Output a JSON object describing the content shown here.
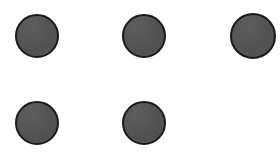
{
  "canvas": {
    "width": 280,
    "height": 166,
    "background_color": "#ffffff"
  },
  "figure": {
    "shape_count": 5,
    "grid": {
      "columns": 3,
      "rows": 2,
      "missing_slots": [
        "row-2-col-3"
      ]
    },
    "fill_color": "#4f4f4f",
    "stroke_color": "#1a1a1a"
  },
  "shapes": [
    {
      "name": "circle-row1-col1",
      "row": 1,
      "column": 1,
      "x": 15,
      "y": 14,
      "diameter": 44,
      "border_width": 2,
      "fill": "#4f4f4f",
      "stroke": "#1a1a1a"
    },
    {
      "name": "circle-row1-col2",
      "row": 1,
      "column": 2,
      "x": 122,
      "y": 14,
      "diameter": 44,
      "border_width": 2,
      "fill": "#4f4f4f",
      "stroke": "#1a1a1a"
    },
    {
      "name": "circle-row1-col3",
      "row": 1,
      "column": 3,
      "x": 230,
      "y": 13,
      "diameter": 46,
      "border_width": 2,
      "fill": "#4f4f4f",
      "stroke": "#1a1a1a"
    },
    {
      "name": "circle-row2-col1",
      "row": 2,
      "column": 1,
      "x": 15,
      "y": 101,
      "diameter": 44,
      "border_width": 2,
      "fill": "#4f4f4f",
      "stroke": "#1a1a1a"
    },
    {
      "name": "circle-row2-col2",
      "row": 2,
      "column": 2,
      "x": 122,
      "y": 101,
      "diameter": 44,
      "border_width": 2,
      "fill": "#4f4f4f",
      "stroke": "#1a1a1a"
    }
  ]
}
